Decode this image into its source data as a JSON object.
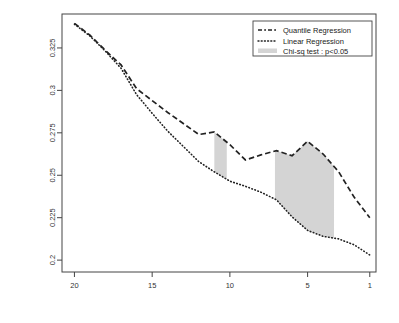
{
  "chart_data": {
    "type": "line",
    "title": "",
    "xlabel": "top percentage considered",
    "ylabel": "ordered hit-rate",
    "xlim": [
      20.8,
      0.6
    ],
    "ylim": [
      0.193,
      0.345
    ],
    "x_reversed": true,
    "grid": false,
    "xticks": [
      "20",
      "15",
      "10",
      "5",
      "1"
    ],
    "xtick_values": [
      20,
      15,
      10,
      5,
      1
    ],
    "yticks": [
      "0.2",
      "0.225",
      "0.25",
      "0.275",
      "0.3",
      "0.325"
    ],
    "ytick_values": [
      0.2,
      0.225,
      0.25,
      0.275,
      0.3,
      0.325
    ],
    "legend_position": "top-right",
    "x": [
      20,
      19,
      18,
      17,
      16,
      15,
      14,
      13,
      12,
      11,
      10,
      9,
      8,
      7,
      6,
      5,
      4,
      3,
      2,
      1
    ],
    "series": [
      {
        "name": "Quantile Regression",
        "style": "dashed",
        "color": "#222222",
        "values": [
          0.3395,
          0.3325,
          0.3235,
          0.315,
          0.301,
          0.294,
          0.287,
          0.2805,
          0.274,
          0.2755,
          0.268,
          0.259,
          0.262,
          0.2645,
          0.2615,
          0.27,
          0.2625,
          0.252,
          0.237,
          0.225
        ]
      },
      {
        "name": "Linear Regression",
        "style": "dotted",
        "color": "#222222",
        "values": [
          0.339,
          0.332,
          0.323,
          0.313,
          0.2975,
          0.2865,
          0.276,
          0.267,
          0.258,
          0.252,
          0.2465,
          0.2435,
          0.24,
          0.2355,
          0.2255,
          0.2175,
          0.214,
          0.2125,
          0.209,
          0.203
        ]
      }
    ],
    "shaded_regions": [
      {
        "label": "Chi-sq test : p<0.05",
        "x_start": 11.0,
        "x_end": 10.2,
        "color": "#d4d4d4"
      },
      {
        "label": "Chi-sq test : p<0.05",
        "x_start": 7.1,
        "x_end": 3.3,
        "color": "#d4d4d4"
      }
    ],
    "legend": [
      {
        "label": "Quantile Regression",
        "marker": "dashed-line"
      },
      {
        "label": "Linear Regression",
        "marker": "dotted-line"
      },
      {
        "label": "Chi-sq test : p<0.05",
        "marker": "filled-band"
      }
    ],
    "colors": {
      "line": "#222222",
      "band": "#d4d4d4",
      "axis": "#444444",
      "background": "#ffffff"
    }
  }
}
